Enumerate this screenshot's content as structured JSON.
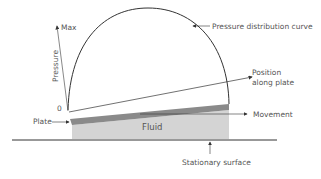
{
  "diagram": {
    "labels": {
      "max": "Max",
      "pressure": "Pressure",
      "zero": "0",
      "curve": "Pressure distribution curve",
      "position_line1": "Position",
      "position_line2": "along plate",
      "plate": "Plate",
      "fluid": "Fluid",
      "movement": "Movement",
      "stationary": "Stationary surface"
    },
    "colors": {
      "plate": "#8a8a8a",
      "fluid": "#d4d4d4",
      "line": "#333333",
      "text": "#555555"
    }
  }
}
